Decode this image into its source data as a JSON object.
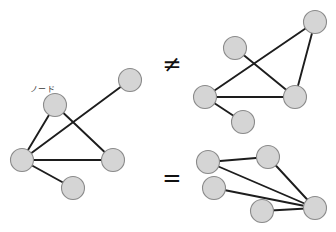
{
  "figure": {
    "width": 336,
    "height": 232,
    "background_color": "#ffffff",
    "node_fill_color": "#d5d5d5",
    "node_stroke_color": "#8a8a8a",
    "edge_color": "#1d1d1d",
    "node_radius": 11.5,
    "annotations": {
      "node_label": "ノード",
      "node_label_x": 30,
      "node_label_y": 92
    },
    "relations": [
      {
        "id": "not-equal",
        "symbol": "≠",
        "x": 172,
        "y": 64
      },
      {
        "id": "equal",
        "symbol": "=",
        "x": 172,
        "y": 178
      }
    ],
    "graphs": [
      {
        "id": "left-graph",
        "name": "left-graph",
        "nodes": [
          {
            "id": "L1",
            "x": 55,
            "y": 105
          },
          {
            "id": "L2",
            "x": 130,
            "y": 80
          },
          {
            "id": "L3",
            "x": 22,
            "y": 160
          },
          {
            "id": "L4",
            "x": 113,
            "y": 160
          },
          {
            "id": "L5",
            "x": 73,
            "y": 188
          }
        ],
        "edges": [
          [
            "L1",
            "L3"
          ],
          [
            "L1",
            "L4"
          ],
          [
            "L2",
            "L3"
          ],
          [
            "L3",
            "L4"
          ],
          [
            "L3",
            "L5"
          ]
        ]
      },
      {
        "id": "top-right-graph",
        "name": "top-right-graph",
        "nodes": [
          {
            "id": "T1",
            "x": 315,
            "y": 22
          },
          {
            "id": "T2",
            "x": 235,
            "y": 48
          },
          {
            "id": "T3",
            "x": 205,
            "y": 97
          },
          {
            "id": "T4",
            "x": 295,
            "y": 97
          },
          {
            "id": "T5",
            "x": 243,
            "y": 122
          }
        ],
        "edges": [
          [
            "T1",
            "T3"
          ],
          [
            "T1",
            "T4"
          ],
          [
            "T2",
            "T4"
          ],
          [
            "T3",
            "T4"
          ],
          [
            "T3",
            "T5"
          ]
        ]
      },
      {
        "id": "bottom-right-graph",
        "name": "bottom-right-graph",
        "nodes": [
          {
            "id": "B1",
            "x": 208,
            "y": 162
          },
          {
            "id": "B2",
            "x": 268,
            "y": 157
          },
          {
            "id": "B3",
            "x": 214,
            "y": 188
          },
          {
            "id": "B4",
            "x": 262,
            "y": 211
          },
          {
            "id": "B5",
            "x": 315,
            "y": 208
          }
        ],
        "edges": [
          [
            "B1",
            "B2"
          ],
          [
            "B1",
            "B5"
          ],
          [
            "B2",
            "B5"
          ],
          [
            "B3",
            "B5"
          ],
          [
            "B4",
            "B5"
          ]
        ]
      }
    ]
  }
}
